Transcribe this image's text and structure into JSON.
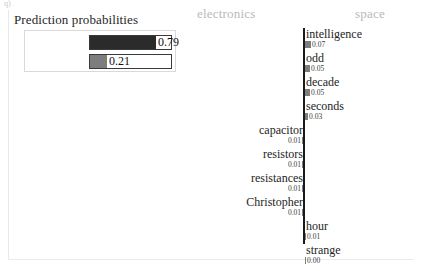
{
  "figure": {
    "artifact_text": "q) .",
    "background": "#ffffff",
    "frame_color": "#e8e8e8"
  },
  "prediction_probabilities": {
    "title": "Prediction probabilities",
    "rows": [
      {
        "label": "electronics",
        "value": 0.79,
        "value_text": "0.79",
        "color": "#2b2b2b"
      },
      {
        "label": "space",
        "value": 0.21,
        "value_text": "0.21",
        "color": "#7d7d7d"
      }
    ]
  },
  "explanation": {
    "headers": [
      {
        "label": "electronics",
        "side": "left",
        "color": "#b9b9b9"
      },
      {
        "label": "space",
        "side": "right",
        "color": "#b9b9b9"
      }
    ],
    "axis_color": "#1a1a1a",
    "bar_color": "#7d7d7d",
    "features": [
      {
        "word": "intelligence",
        "weight": 0.07,
        "value_text": "0.07",
        "side": "right"
      },
      {
        "word": "odd",
        "weight": 0.05,
        "value_text": "0.05",
        "side": "right"
      },
      {
        "word": "decade",
        "weight": 0.05,
        "value_text": "0.05",
        "side": "right"
      },
      {
        "word": "seconds",
        "weight": 0.03,
        "value_text": "0.03",
        "side": "right"
      },
      {
        "word": "capacitor",
        "weight": 0.01,
        "value_text": "0.01",
        "side": "left"
      },
      {
        "word": "resistors",
        "weight": 0.01,
        "value_text": "0.01",
        "side": "left"
      },
      {
        "word": "resistances",
        "weight": 0.01,
        "value_text": "0.01",
        "side": "left"
      },
      {
        "word": "Christopher",
        "weight": 0.01,
        "value_text": "0.01",
        "side": "left"
      },
      {
        "word": "hour",
        "weight": 0.01,
        "value_text": "0.01",
        "side": "right"
      },
      {
        "word": "strange",
        "weight": 0.0,
        "value_text": "0.00",
        "side": "right"
      }
    ]
  },
  "chart_data": {
    "type": "bar",
    "orientation": "horizontal-diverging",
    "xlabel": "",
    "ylabel": "",
    "class_left": "electronics",
    "class_right": "space",
    "prediction_probabilities": {
      "categories": [
        "electronics",
        "space"
      ],
      "values": [
        0.79,
        0.21
      ]
    },
    "categories": [
      "intelligence",
      "odd",
      "decade",
      "seconds",
      "capacitor",
      "resistors",
      "resistances",
      "Christopher",
      "hour",
      "strange"
    ],
    "values": [
      0.07,
      0.05,
      0.05,
      0.03,
      -0.01,
      -0.01,
      -0.01,
      -0.01,
      0.01,
      0.0
    ],
    "sides": [
      "right",
      "right",
      "right",
      "right",
      "left",
      "left",
      "left",
      "left",
      "right",
      "right"
    ],
    "legend": [
      "electronics",
      "space"
    ],
    "grid": false
  }
}
